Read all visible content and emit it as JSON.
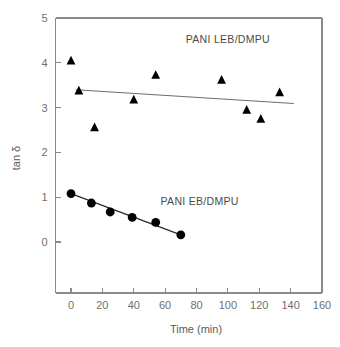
{
  "chart_data": {
    "type": "scatter",
    "title": "",
    "xlabel": "Time (min)",
    "ylabel": "tan δ",
    "xlim": [
      0,
      160
    ],
    "ylim": [
      0,
      5
    ],
    "xticks": [
      0,
      20,
      40,
      60,
      80,
      100,
      120,
      140,
      160
    ],
    "yticks": [
      0,
      1,
      2,
      3,
      4,
      5
    ],
    "xtick_labels": [
      "0",
      "20",
      "40",
      "60",
      "80",
      "100",
      "120",
      "140",
      "160"
    ],
    "ytick_labels": [
      "0",
      "1",
      "2",
      "3",
      "4",
      "5"
    ],
    "grid": false,
    "legend_position": "inline-annotation",
    "series": [
      {
        "name": "PANI LEB/DMPU",
        "marker": "triangle",
        "color": "#000000",
        "x": [
          0,
          5,
          15,
          40,
          54,
          96,
          112,
          121,
          133
        ],
        "values": [
          4.04,
          3.37,
          2.55,
          3.17,
          3.72,
          3.61,
          2.94,
          2.74,
          3.33
        ],
        "trendline": {
          "x": [
            3,
            142
          ],
          "y": [
            3.4,
            3.09
          ]
        },
        "annotation": "PANI LEB/DMPU",
        "annotation_x": 100,
        "annotation_y": 4.45
      },
      {
        "name": "PANI EB/DMPU",
        "marker": "circle",
        "color": "#000000",
        "x": [
          0,
          13,
          25,
          39,
          54,
          70
        ],
        "values": [
          1.08,
          0.87,
          0.67,
          0.55,
          0.44,
          0.16
        ],
        "trendline": {
          "x": [
            0,
            70
          ],
          "y": [
            1.08,
            0.16
          ]
        },
        "annotation": "PANI EB/DMPU",
        "annotation_x": 82,
        "annotation_y": 0.82
      }
    ]
  },
  "axes": {
    "x_title": "Time (min)",
    "y_title": "tan δ"
  },
  "annotations": {
    "upper_series_label": "PANI LEB/DMPU",
    "lower_series_label": "PANI EB/DMPU"
  },
  "colors": {
    "marker": "#000000",
    "axis": "#8a8a8a",
    "tick_text": "#6f6f6f",
    "fit_line_upper": "#6d6d6d",
    "fit_line_lower": "#2a2a2a",
    "background": "#ffffff"
  }
}
